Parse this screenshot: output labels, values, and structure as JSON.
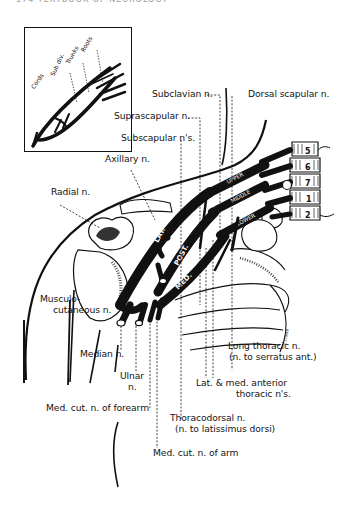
{
  "page_header": "174   TEXTBOOK OF NEUROLOGY",
  "inset": {
    "labels": [
      "Cords",
      "Sub div.",
      "Trunks",
      "Roots"
    ]
  },
  "cords": [
    "LAT.",
    "POST.",
    "MED."
  ],
  "trunks": [
    "UPPER",
    "MIDDLE",
    "LOWER"
  ],
  "divisions": [
    "A.",
    "P."
  ],
  "vertebrae": [
    "5",
    "6",
    "7",
    "1",
    "2"
  ],
  "labels": {
    "subclavian": "Subclavian n.",
    "dorsal_scapular": "Dorsal scapular n.",
    "suprascapular": "Suprascapular n.",
    "subscapular": "Subscapular n's.",
    "axillary": "Axillary n.",
    "radial": "Radial n.",
    "musculocutaneous_1": "Musculo-",
    "musculocutaneous_2": "cutaneous n.",
    "median": "Median n.",
    "ulnar_1": "Ulnar",
    "ulnar_2": "n.",
    "med_cut_forearm": "Med. cut. n. of forearm",
    "long_thoracic_1": "Long thoracic n.",
    "long_thoracic_2": "(n. to serratus ant.)",
    "anterior_thoracic_1": "Lat. & med. anterior",
    "anterior_thoracic_2": "thoracic n's.",
    "thoracodorsal_1": "Thoracodorsal n.",
    "thoracodorsal_2": "(n. to latissimus dorsi)",
    "med_cut_arm": "Med. cut. n. of arm"
  }
}
